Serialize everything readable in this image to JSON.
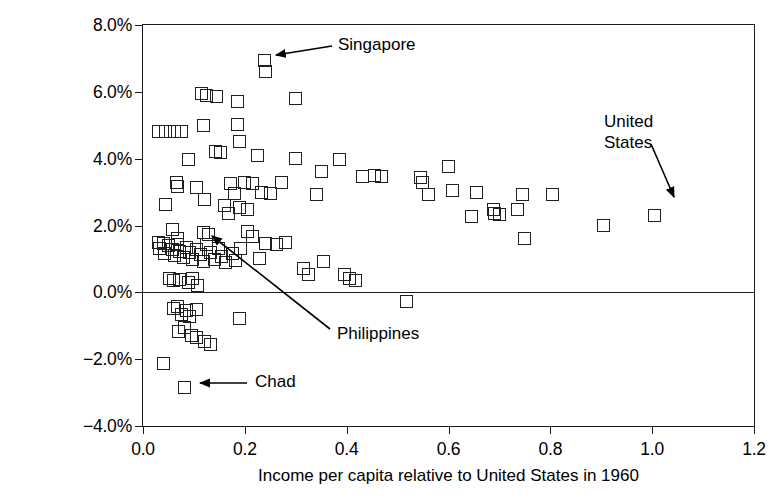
{
  "chart_data": {
    "type": "scatter",
    "title": "",
    "xlabel": "Income per capita relative to United States in 1960",
    "ylabel": "Average annual growth in income\nper capita, 1960–1985",
    "xlim": [
      0.0,
      1.2
    ],
    "ylim": [
      -4.0,
      8.0
    ],
    "xticks": [
      "0.0",
      "0.2",
      "0.4",
      "0.6",
      "0.8",
      "1.0",
      "1.2"
    ],
    "xtick_values": [
      0.0,
      0.2,
      0.4,
      0.6,
      0.8,
      1.0,
      1.2
    ],
    "yticks": [
      "8.0%",
      "6.0%",
      "4.0%",
      "2.0%",
      "0.0%",
      "−2.0%",
      "−4.0%"
    ],
    "ytick_values": [
      8.0,
      6.0,
      4.0,
      2.0,
      0.0,
      -2.0,
      -4.0
    ],
    "grid": false,
    "legend": null,
    "reference_lines": [
      {
        "axis": "y",
        "value": 0.0
      }
    ],
    "marker_style": "open-square",
    "marker_color": "#1f1f1f",
    "points": [
      [
        0.03,
        4.8
      ],
      [
        0.045,
        4.8
      ],
      [
        0.062,
        4.8
      ],
      [
        0.075,
        4.82
      ],
      [
        0.115,
        5.95
      ],
      [
        0.125,
        5.88
      ],
      [
        0.145,
        5.85
      ],
      [
        0.185,
        5.7
      ],
      [
        0.3,
        5.8
      ],
      [
        0.238,
        6.95
      ],
      [
        0.24,
        6.62
      ],
      [
        0.118,
        5.0
      ],
      [
        0.185,
        5.02
      ],
      [
        0.19,
        4.52
      ],
      [
        0.09,
        3.98
      ],
      [
        0.143,
        4.2
      ],
      [
        0.153,
        4.18
      ],
      [
        0.225,
        4.1
      ],
      [
        0.3,
        4.0
      ],
      [
        0.385,
        3.98
      ],
      [
        0.065,
        3.3
      ],
      [
        0.068,
        3.18
      ],
      [
        0.105,
        3.15
      ],
      [
        0.172,
        3.25
      ],
      [
        0.18,
        2.95
      ],
      [
        0.2,
        3.3
      ],
      [
        0.215,
        3.25
      ],
      [
        0.232,
        3.0
      ],
      [
        0.25,
        2.95
      ],
      [
        0.045,
        2.62
      ],
      [
        0.19,
        2.55
      ],
      [
        0.205,
        2.48
      ],
      [
        0.12,
        2.78
      ],
      [
        0.16,
        2.6
      ],
      [
        0.168,
        2.35
      ],
      [
        0.272,
        3.3
      ],
      [
        0.34,
        2.92
      ],
      [
        0.35,
        3.62
      ],
      [
        0.432,
        3.48
      ],
      [
        0.455,
        3.5
      ],
      [
        0.468,
        3.48
      ],
      [
        0.545,
        3.45
      ],
      [
        0.548,
        3.28
      ],
      [
        0.56,
        2.92
      ],
      [
        0.6,
        3.78
      ],
      [
        0.608,
        3.05
      ],
      [
        0.655,
        3.0
      ],
      [
        0.688,
        2.48
      ],
      [
        0.69,
        2.35
      ],
      [
        0.7,
        2.32
      ],
      [
        0.645,
        2.28
      ],
      [
        0.745,
        2.92
      ],
      [
        0.735,
        2.48
      ],
      [
        0.805,
        2.92
      ],
      [
        0.75,
        1.62
      ],
      [
        0.905,
        2.0
      ],
      [
        1.005,
        2.3
      ],
      [
        0.03,
        1.5
      ],
      [
        0.033,
        1.32
      ],
      [
        0.04,
        1.45
      ],
      [
        0.042,
        1.15
      ],
      [
        0.05,
        1.4
      ],
      [
        0.058,
        1.28
      ],
      [
        0.062,
        1.1
      ],
      [
        0.068,
        1.42
      ],
      [
        0.072,
        1.22
      ],
      [
        0.08,
        1.05
      ],
      [
        0.085,
        1.35
      ],
      [
        0.092,
        1.18
      ],
      [
        0.098,
        0.98
      ],
      [
        0.105,
        1.28
      ],
      [
        0.112,
        1.12
      ],
      [
        0.118,
        0.92
      ],
      [
        0.125,
        1.42
      ],
      [
        0.133,
        1.2
      ],
      [
        0.14,
        0.98
      ],
      [
        0.148,
        1.3
      ],
      [
        0.155,
        1.08
      ],
      [
        0.162,
        0.88
      ],
      [
        0.118,
        1.78
      ],
      [
        0.128,
        1.72
      ],
      [
        0.058,
        1.88
      ],
      [
        0.068,
        1.62
      ],
      [
        0.175,
        1.15
      ],
      [
        0.182,
        0.95
      ],
      [
        0.192,
        1.32
      ],
      [
        0.205,
        1.82
      ],
      [
        0.215,
        1.68
      ],
      [
        0.228,
        1.0
      ],
      [
        0.24,
        1.45
      ],
      [
        0.262,
        1.42
      ],
      [
        0.28,
        1.5
      ],
      [
        0.315,
        0.72
      ],
      [
        0.325,
        0.52
      ],
      [
        0.355,
        0.92
      ],
      [
        0.395,
        0.52
      ],
      [
        0.405,
        0.42
      ],
      [
        0.418,
        0.35
      ],
      [
        0.052,
        0.42
      ],
      [
        0.06,
        0.35
      ],
      [
        0.072,
        0.38
      ],
      [
        0.09,
        0.28
      ],
      [
        0.098,
        0.42
      ],
      [
        0.108,
        0.2
      ],
      [
        0.06,
        -0.48
      ],
      [
        0.068,
        -0.42
      ],
      [
        0.075,
        -0.65
      ],
      [
        0.085,
        -0.55
      ],
      [
        0.092,
        -0.72
      ],
      [
        0.105,
        -0.5
      ],
      [
        0.07,
        -1.18
      ],
      [
        0.082,
        -1.05
      ],
      [
        0.095,
        -1.28
      ],
      [
        0.105,
        -1.35
      ],
      [
        0.12,
        -1.48
      ],
      [
        0.132,
        -1.55
      ],
      [
        0.04,
        -2.12
      ],
      [
        0.19,
        -0.78
      ],
      [
        0.082,
        -2.85
      ],
      [
        0.518,
        -0.28
      ]
    ],
    "annotations": [
      {
        "label": "Singapore",
        "target": [
          0.238,
          6.95
        ],
        "note": "arrow points left to top-most pair of markers"
      },
      {
        "label": "United\nStates",
        "target": [
          1.005,
          2.3
        ],
        "note": "arrow points down-right to marker"
      },
      {
        "label": "Philippines",
        "target": [
          0.12,
          1.78
        ],
        "note": "arrow points up-left to marker"
      },
      {
        "label": "Chad",
        "target": [
          0.082,
          -2.85
        ],
        "note": "arrow points left to marker"
      }
    ]
  }
}
